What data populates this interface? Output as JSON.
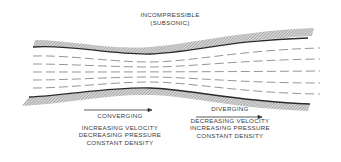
{
  "title": {
    "line1": "INCOMPRESSIBLE",
    "line2": "(SUBSONIC)"
  },
  "sections": [
    {
      "heading": "CONVERGING",
      "arrow": "right-arrow",
      "lines": [
        "INCREASING VELOCITY",
        "DECREASING PRESSURE",
        "CONSTANT DENSITY"
      ]
    },
    {
      "heading": "DIVERGING",
      "arrow": "right-arrow",
      "lines": [
        "DECREASING VELOCITY",
        "INCREASING PRESSURE",
        "CONSTANT DENSITY"
      ]
    }
  ],
  "colors": {
    "wall_line": "#2a2a2a",
    "hatch": "#9a9a9a",
    "streamline": "#8a8a8a",
    "text": "#3a3a3a"
  }
}
